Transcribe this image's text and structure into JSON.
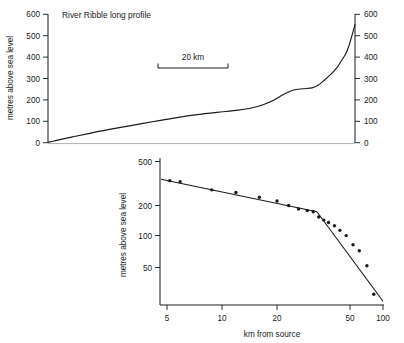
{
  "chart_data": [
    {
      "type": "line",
      "title": "River Ribble long profile",
      "ylabel": "metres above sea level",
      "xlabel": "",
      "ylim": [
        0,
        600
      ],
      "yticks": [
        0,
        100,
        200,
        300,
        400,
        500,
        600
      ],
      "ytick_labels": [
        "0",
        "100",
        "200",
        "300",
        "400",
        "500",
        "600"
      ],
      "right_axis": true,
      "right_yticks": [
        0,
        100,
        200,
        300,
        400,
        500,
        600
      ],
      "right_ytick_labels": [
        "0",
        "100",
        "200",
        "300",
        "400",
        "500",
        "600"
      ],
      "grid": false,
      "legend": "none",
      "scalebar": {
        "label": "20 km",
        "length_km": 20
      },
      "annotation": "Long profile from mouth (left) to source (right); knickpoint step near 250 m.",
      "x": [
        0,
        2,
        5,
        9,
        14,
        20,
        27,
        34,
        41,
        48,
        55,
        62,
        68,
        73,
        77,
        80,
        83,
        86,
        88,
        90,
        92,
        94,
        95.5,
        97,
        98,
        99,
        100
      ],
      "values": [
        2,
        8,
        18,
        30,
        45,
        62,
        80,
        98,
        115,
        130,
        142,
        152,
        168,
        195,
        228,
        246,
        252,
        256,
        268,
        292,
        318,
        348,
        382,
        416,
        452,
        500,
        552
      ]
    },
    {
      "type": "scatter",
      "title": "",
      "xlabel": "km from source",
      "ylabel": "metres above sea level",
      "xscale": "log",
      "yscale": "log",
      "xlim": [
        4,
        105
      ],
      "ylim": [
        20,
        560
      ],
      "xticks": [
        5,
        10,
        20,
        50,
        100
      ],
      "xtick_labels": [
        "5",
        "10",
        "20",
        "50",
        "100"
      ],
      "yticks": [
        50,
        100,
        200,
        500
      ],
      "ytick_labels": [
        "50",
        "100",
        "200",
        "500"
      ],
      "grid": false,
      "legend": "none",
      "points_x": [
        5.2,
        6.0,
        9.3,
        13.0,
        18.0,
        23.0,
        27.0,
        31.0,
        35.0,
        38.0,
        41.0,
        44.0,
        47.0,
        51.0,
        55.0,
        60.0,
        66.0,
        72.0,
        80.0,
        88.0
      ],
      "points_y": [
        330,
        322,
        270,
        255,
        230,
        212,
        192,
        178,
        172,
        168,
        150,
        140,
        133,
        124,
        112,
        100,
        82,
        72,
        52,
        28
      ],
      "fit_segments": [
        {
          "name": "upper-reach-fit",
          "x": [
            4.6,
            40.0
          ],
          "y": [
            340,
            168
          ]
        },
        {
          "name": "lower-reach-fit",
          "x": [
            40.0,
            100.0
          ],
          "y": [
            168,
            24
          ]
        }
      ],
      "breakpoint_km": 40
    }
  ],
  "top_edge": {
    "artifact_text": ""
  }
}
